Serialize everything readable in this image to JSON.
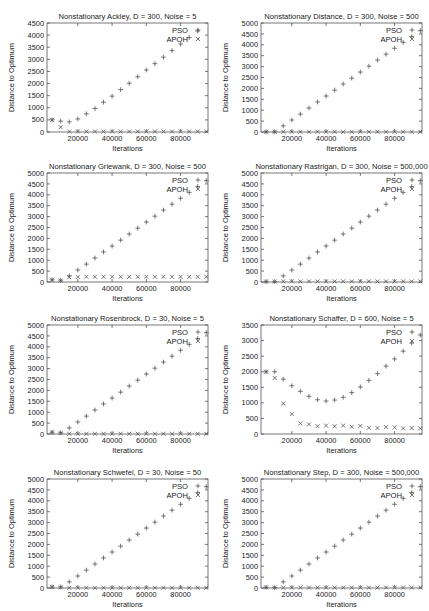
{
  "chart_data": [
    {
      "type": "scatter",
      "title": "Nonstationary Ackley, D = 300, Noise = 5",
      "xlabel": "Iterations",
      "ylabel": "Distance to Optimum",
      "xlim": [
        2000,
        96000
      ],
      "ylim": [
        0,
        4500
      ],
      "yticks": [
        0,
        500,
        1000,
        1500,
        2000,
        2500,
        3000,
        3500,
        4000,
        4500
      ],
      "xticks": [
        20000,
        40000,
        60000,
        80000
      ],
      "legend_position": "top-right",
      "x": [
        5000,
        10000,
        15000,
        20000,
        25000,
        30000,
        35000,
        40000,
        45000,
        50000,
        55000,
        60000,
        65000,
        70000,
        75000,
        80000,
        85000,
        90000,
        95000
      ],
      "series": [
        {
          "name": "PSO",
          "marker": "+",
          "values": [
            500,
            450,
            420,
            540,
            750,
            970,
            1230,
            1480,
            1750,
            2010,
            2280,
            2560,
            2820,
            3090,
            3360,
            3630,
            3900,
            4170,
            null
          ]
        },
        {
          "name": "APOH",
          "marker": "x",
          "values": [
            500,
            200,
            20,
            20,
            20,
            20,
            20,
            20,
            20,
            20,
            20,
            20,
            20,
            20,
            20,
            20,
            20,
            20,
            20
          ]
        }
      ]
    },
    {
      "type": "scatter",
      "title": "Nonstationary Distance, D = 300, Noise = 500",
      "xlabel": "Iterations",
      "ylabel": "Distance to Optimum",
      "xlim": [
        2000,
        96000
      ],
      "ylim": [
        0,
        5000
      ],
      "yticks": [
        0,
        500,
        1000,
        1500,
        2000,
        2500,
        3000,
        3500,
        4000,
        4500,
        5000
      ],
      "xticks": [
        20000,
        40000,
        60000,
        80000
      ],
      "legend_position": "top-right",
      "x": [
        5000,
        10000,
        15000,
        20000,
        25000,
        30000,
        35000,
        40000,
        45000,
        50000,
        55000,
        60000,
        65000,
        70000,
        75000,
        80000,
        85000,
        90000,
        95000
      ],
      "series": [
        {
          "name": "PSO",
          "marker": "+",
          "values": [
            10,
            10,
            280,
            550,
            820,
            1100,
            1380,
            1650,
            1920,
            2200,
            2470,
            2750,
            3020,
            3300,
            3570,
            3840,
            4110,
            4380,
            4650
          ]
        },
        {
          "name": "APOH",
          "marker": "x",
          "values": [
            10,
            10,
            10,
            10,
            10,
            10,
            10,
            10,
            10,
            10,
            10,
            10,
            10,
            10,
            10,
            10,
            10,
            10,
            10
          ]
        }
      ]
    },
    {
      "type": "scatter",
      "title": "Nonstationary Griewank, D = 300, Noise = 500",
      "xlabel": "Iterations",
      "ylabel": "Distance to Optimum",
      "xlim": [
        2000,
        96000
      ],
      "ylim": [
        0,
        5000
      ],
      "yticks": [
        0,
        500,
        1000,
        1500,
        2000,
        2500,
        3000,
        3500,
        4000,
        4500,
        5000
      ],
      "xticks": [
        20000,
        40000,
        60000,
        80000
      ],
      "legend_position": "top-right",
      "x": [
        5000,
        10000,
        15000,
        20000,
        25000,
        30000,
        35000,
        40000,
        45000,
        50000,
        55000,
        60000,
        65000,
        70000,
        75000,
        80000,
        85000,
        90000,
        95000
      ],
      "series": [
        {
          "name": "PSO",
          "marker": "+",
          "values": [
            100,
            80,
            280,
            550,
            820,
            1100,
            1380,
            1650,
            1920,
            2200,
            2470,
            2750,
            3020,
            3300,
            3570,
            3840,
            4110,
            4380,
            4650
          ]
        },
        {
          "name": "APOH",
          "marker": "x",
          "values": [
            100,
            60,
            220,
            230,
            240,
            240,
            240,
            240,
            240,
            240,
            240,
            240,
            240,
            240,
            240,
            240,
            240,
            240,
            240
          ]
        }
      ]
    },
    {
      "type": "scatter",
      "title": "Nonstationary Rastrigan, D = 300, Noise = 500,000",
      "xlabel": "Iterations",
      "ylabel": "Distance to Optimum",
      "xlim": [
        2000,
        96000
      ],
      "ylim": [
        0,
        5000
      ],
      "yticks": [
        0,
        500,
        1000,
        1500,
        2000,
        2500,
        3000,
        3500,
        4000,
        4500,
        5000
      ],
      "xticks": [
        20000,
        40000,
        60000,
        80000
      ],
      "legend_position": "top-right",
      "x": [
        5000,
        10000,
        15000,
        20000,
        25000,
        30000,
        35000,
        40000,
        45000,
        50000,
        55000,
        60000,
        65000,
        70000,
        75000,
        80000,
        85000,
        90000,
        95000
      ],
      "series": [
        {
          "name": "PSO",
          "marker": "+",
          "values": [
            20,
            20,
            280,
            550,
            820,
            1100,
            1380,
            1650,
            1920,
            2200,
            2470,
            2750,
            3020,
            3300,
            3570,
            3840,
            4110,
            4380,
            4650
          ]
        },
        {
          "name": "APOH",
          "marker": "x",
          "values": [
            20,
            20,
            30,
            30,
            30,
            30,
            30,
            30,
            30,
            30,
            30,
            30,
            30,
            30,
            30,
            30,
            30,
            30,
            30
          ]
        }
      ]
    },
    {
      "type": "scatter",
      "title": "Nonstationary Rosenbrock, D = 30, Noise = 5",
      "xlabel": "Iterations",
      "ylabel": "Distance to Optimum",
      "xlim": [
        2000,
        96000
      ],
      "ylim": [
        0,
        5000
      ],
      "yticks": [
        0,
        500,
        1000,
        1500,
        2000,
        2500,
        3000,
        3500,
        4000,
        4500,
        5000
      ],
      "xticks": [
        20000,
        40000,
        60000,
        80000
      ],
      "legend_position": "top-right",
      "x": [
        5000,
        10000,
        15000,
        20000,
        25000,
        30000,
        35000,
        40000,
        45000,
        50000,
        55000,
        60000,
        65000,
        70000,
        75000,
        80000,
        85000,
        90000,
        95000
      ],
      "series": [
        {
          "name": "PSO",
          "marker": "+",
          "values": [
            80,
            60,
            280,
            550,
            820,
            1100,
            1380,
            1650,
            1920,
            2200,
            2470,
            2750,
            3020,
            3300,
            3570,
            3840,
            4110,
            4380,
            4650
          ]
        },
        {
          "name": "APOH",
          "marker": "x",
          "values": [
            80,
            40,
            10,
            10,
            10,
            10,
            10,
            10,
            10,
            10,
            10,
            10,
            10,
            10,
            10,
            10,
            10,
            10,
            10
          ]
        }
      ]
    },
    {
      "type": "scatter",
      "title": "Nonstationary Schaffer, D = 600, Noise = 5",
      "xlabel": "Iterations",
      "ylabel": "Distance to Optimum",
      "xlim": [
        2000,
        96000
      ],
      "ylim": [
        0,
        3500
      ],
      "yticks": [
        0,
        500,
        1000,
        1500,
        2000,
        2500,
        3000,
        3500
      ],
      "xticks": [
        20000,
        40000,
        60000,
        80000
      ],
      "legend_position": "top-right",
      "x": [
        5000,
        10000,
        15000,
        20000,
        25000,
        30000,
        35000,
        40000,
        45000,
        50000,
        55000,
        60000,
        65000,
        70000,
        75000,
        80000,
        85000,
        90000,
        95000
      ],
      "series": [
        {
          "name": "PSO",
          "marker": "+",
          "values": [
            2000,
            2000,
            1760,
            1550,
            1370,
            1210,
            1100,
            1060,
            1090,
            1180,
            1330,
            1510,
            1720,
            1940,
            2180,
            2410,
            2660,
            2920,
            3180
          ]
        },
        {
          "name": "APOH",
          "marker": "x",
          "values": [
            2000,
            1800,
            980,
            640,
            340,
            310,
            250,
            270,
            250,
            270,
            230,
            260,
            200,
            190,
            220,
            210,
            180,
            190,
            180
          ]
        }
      ]
    },
    {
      "type": "scatter",
      "title": "Nonstationary Schwefel, D = 30, Noise = 50",
      "xlabel": "Iterations",
      "ylabel": "Distance to Optimum",
      "xlim": [
        2000,
        96000
      ],
      "ylim": [
        0,
        5000
      ],
      "yticks": [
        0,
        500,
        1000,
        1500,
        2000,
        2500,
        3000,
        3500,
        4000,
        4500,
        5000
      ],
      "xticks": [
        20000,
        40000,
        60000,
        80000
      ],
      "legend_position": "top-right",
      "x": [
        5000,
        10000,
        15000,
        20000,
        25000,
        30000,
        35000,
        40000,
        45000,
        50000,
        55000,
        60000,
        65000,
        70000,
        75000,
        80000,
        85000,
        90000,
        95000
      ],
      "series": [
        {
          "name": "PSO",
          "marker": "+",
          "values": [
            50,
            50,
            280,
            550,
            820,
            1100,
            1380,
            1650,
            1920,
            2200,
            2470,
            2750,
            3020,
            3300,
            3570,
            3840,
            4110,
            4380,
            4650
          ]
        },
        {
          "name": "APOH",
          "marker": "x",
          "values": [
            50,
            30,
            10,
            10,
            10,
            10,
            10,
            10,
            10,
            10,
            10,
            10,
            10,
            10,
            10,
            10,
            10,
            10,
            10
          ]
        }
      ]
    },
    {
      "type": "scatter",
      "title": "Nonstationary Step, D = 300, Noise = 500,000",
      "xlabel": "Iterations",
      "ylabel": "Distance to Optimum",
      "xlim": [
        2000,
        96000
      ],
      "ylim": [
        0,
        5000
      ],
      "yticks": [
        0,
        500,
        1000,
        1500,
        2000,
        2500,
        3000,
        3500,
        4000,
        4500,
        5000
      ],
      "xticks": [
        20000,
        40000,
        60000,
        80000
      ],
      "legend_position": "top-right",
      "x": [
        5000,
        10000,
        15000,
        20000,
        25000,
        30000,
        35000,
        40000,
        45000,
        50000,
        55000,
        60000,
        65000,
        70000,
        75000,
        80000,
        85000,
        90000,
        95000
      ],
      "series": [
        {
          "name": "PSO",
          "marker": "+",
          "values": [
            30,
            20,
            280,
            550,
            820,
            1100,
            1380,
            1650,
            1920,
            2200,
            2470,
            2750,
            3020,
            3300,
            3570,
            3840,
            4110,
            4380,
            4650
          ]
        },
        {
          "name": "APOH",
          "marker": "x",
          "values": [
            30,
            20,
            20,
            20,
            20,
            20,
            20,
            20,
            20,
            20,
            20,
            20,
            20,
            20,
            20,
            20,
            20,
            20,
            20
          ]
        }
      ]
    }
  ],
  "layout": {
    "panels": [
      {
        "left": 0,
        "top": 0
      },
      {
        "left": 214,
        "top": 0
      },
      {
        "left": 0,
        "top": 150
      },
      {
        "left": 214,
        "top": 150
      },
      {
        "left": 0,
        "top": 302
      },
      {
        "left": 214,
        "top": 302
      },
      {
        "left": 0,
        "top": 456
      },
      {
        "left": 214,
        "top": 456
      }
    ],
    "colors": {
      "axis": "#555555",
      "text": "#222222",
      "marker": "#555555"
    }
  }
}
